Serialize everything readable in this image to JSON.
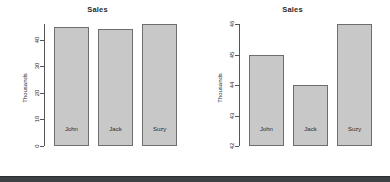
{
  "chart_data": [
    {
      "type": "bar",
      "title": "Sales",
      "xlabel": "",
      "ylabel": "Thousands",
      "categories": [
        "John",
        "Jack",
        "Suzy"
      ],
      "values": [
        45,
        44,
        46
      ],
      "ylim": [
        0,
        46
      ],
      "yticks": [
        0,
        10,
        20,
        30,
        40
      ],
      "ytick_labels": [
        "0",
        "10",
        "20",
        "30",
        "40"
      ],
      "grid": false,
      "legend": "none",
      "bar_fill": "#c8c8c8",
      "bar_border": "#6e6e6e",
      "panel": "left"
    },
    {
      "type": "bar",
      "title": "Sales",
      "xlabel": "",
      "ylabel": "Thousands",
      "categories": [
        "John",
        "Jack",
        "Suzy"
      ],
      "values": [
        45,
        44,
        46
      ],
      "ylim": [
        42,
        46
      ],
      "yticks": [
        42,
        43,
        44,
        45,
        46
      ],
      "ytick_labels": [
        "42",
        "43",
        "44",
        "45",
        "46"
      ],
      "grid": false,
      "legend": "none",
      "bar_fill": "#c8c8c8",
      "bar_border": "#6e6e6e",
      "panel": "right"
    }
  ],
  "left": {
    "title": "Sales",
    "ylabel": "Thousands",
    "ticks": [
      "0",
      "10",
      "20",
      "30",
      "40"
    ],
    "cats": [
      "John",
      "Jack",
      "Suzy"
    ]
  },
  "right": {
    "title": "Sales",
    "ylabel": "Thousands",
    "ticks": [
      "42",
      "43",
      "44",
      "45",
      "46"
    ],
    "cats": [
      "John",
      "Jack",
      "Suzy"
    ]
  },
  "colors": {
    "bar_fill": "#c8c8c8",
    "bar_border": "#6e6e6e",
    "axis": "#555555",
    "text": "#2b2b2b",
    "background": "#ffffff",
    "bottom_bar": "#3c4043"
  }
}
